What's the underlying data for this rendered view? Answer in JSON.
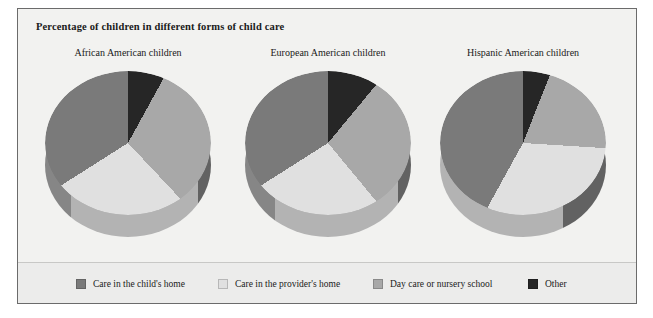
{
  "figure": {
    "title": "Percentage of children in different forms of child care",
    "background_color": "#f2f2f0",
    "border_color": "#6b6b6b",
    "legend_band_color": "#ececeb"
  },
  "legend": {
    "position": "bottom",
    "items": [
      {
        "label": "Care in the child's home",
        "color": "#7a7a7a"
      },
      {
        "label": "Care in the provider's home",
        "color": "#e0e0e0"
      },
      {
        "label": "Day care or nursery school",
        "color": "#a8a8a8"
      },
      {
        "label": "Other",
        "color": "#262626"
      }
    ]
  },
  "chart_data": {
    "type": "pie",
    "title": "Percentage of children in different forms of child care",
    "xlabel": "",
    "ylabel": "",
    "legend_position": "bottom",
    "grid": false,
    "value_unit": "percent",
    "categories": [
      "Care in the child's home",
      "Care in the provider's home",
      "Day care or nursery school",
      "Other"
    ],
    "category_colors": [
      "#7a7a7a",
      "#e0e0e0",
      "#a8a8a8",
      "#262626"
    ],
    "charts": [
      {
        "title": "African American children",
        "slice_order_clockwise_from_12": [
          "Other",
          "Day care or nursery school",
          "Care in the provider's home",
          "Care in the child's home"
        ],
        "values": {
          "Other": 8,
          "Day care or nursery school": 30,
          "Care in the provider's home": 28,
          "Care in the child's home": 34
        }
      },
      {
        "title": "European American children",
        "slice_order_clockwise_from_12": [
          "Other",
          "Day care or nursery school",
          "Care in the provider's home",
          "Care in the child's home"
        ],
        "values": {
          "Other": 11,
          "Day care or nursery school": 28,
          "Care in the provider's home": 27,
          "Care in the child's home": 34
        }
      },
      {
        "title": "Hispanic American children",
        "slice_order_clockwise_from_12": [
          "Other",
          "Day care or nursery school",
          "Care in the provider's home",
          "Care in the child's home"
        ],
        "values": {
          "Other": 6,
          "Day care or nursery school": 20,
          "Care in the provider's home": 32,
          "Care in the child's home": 42
        }
      }
    ]
  }
}
